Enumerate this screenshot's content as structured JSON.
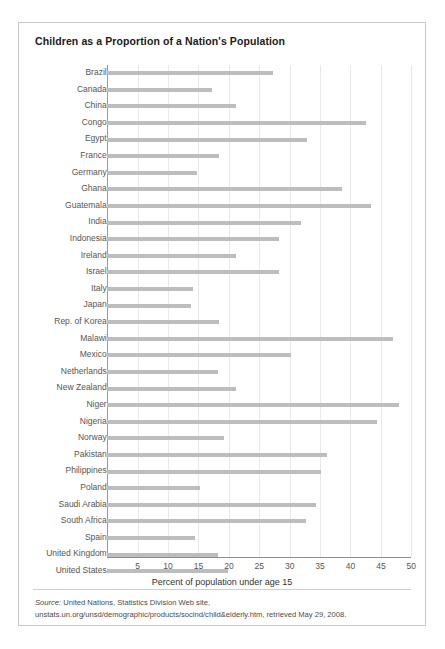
{
  "figure": {
    "title": "Children as a Proportion of a Nation's Population",
    "source_prefix": "Source:",
    "source_text": " United Nations, Statistics Division Web site, unstats.un.org/unsd/demographic/products/socind/child&elderly.htm, retrieved May 29, 2008.",
    "colors": {
      "bar": "#bdbdbd",
      "grid": "#e9e9e9",
      "axis": "#8d8d8d",
      "frame": "#c9c9c9",
      "title_text": "#1b1b1b",
      "label_text": "#555555"
    }
  },
  "chart_data": {
    "type": "bar",
    "orientation": "horizontal",
    "title": "Children as a Proportion of a Nation's Population",
    "xlabel": "Percent of population under age 15",
    "ylabel": "",
    "xlim": [
      0,
      50
    ],
    "xticks": [
      0,
      5,
      10,
      15,
      20,
      25,
      30,
      35,
      40,
      45,
      50
    ],
    "xtick_labels": [
      "",
      "5",
      "10",
      "15",
      "20",
      "25",
      "30",
      "35",
      "40",
      "45",
      "50"
    ],
    "grid": true,
    "legend": "none",
    "categories": [
      "Brazil",
      "Canada",
      "China",
      "Congo",
      "Egypt",
      "France",
      "Germany",
      "Ghana",
      "Guatemala",
      "India",
      "Indonesia",
      "Ireland",
      "Israel",
      "Italy",
      "Japan",
      "Rep. of Korea",
      "Malawi",
      "Mexico",
      "Netherlands",
      "New Zealand",
      "Niger",
      "Nigeria",
      "Norway",
      "Pakistan",
      "Philippines",
      "Poland",
      "Saudi Arabia",
      "South Africa",
      "Spain",
      "United Kingdom",
      "United States"
    ],
    "values": [
      27.3,
      17.3,
      21.2,
      42.5,
      32.8,
      18.3,
      14.7,
      38.6,
      43.4,
      31.8,
      28.2,
      21.2,
      28.2,
      14.1,
      13.8,
      18.3,
      47.0,
      30.2,
      18.2,
      21.2,
      48.0,
      44.4,
      19.2,
      36.1,
      35.1,
      15.3,
      34.3,
      32.6,
      14.5,
      18.2,
      19.8
    ]
  }
}
